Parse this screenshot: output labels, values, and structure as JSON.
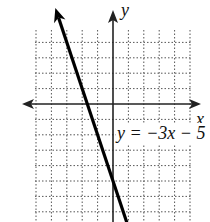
{
  "chart_data": {
    "type": "line",
    "title": "",
    "xlabel": "x",
    "ylabel": "y",
    "equation_label": "y = −3x − 5",
    "grid": true,
    "grid_style": "dotted",
    "xlim": [
      -5,
      5
    ],
    "ylim": [
      -7.5,
      5
    ],
    "series": [
      {
        "name": "y = -3x - 5",
        "slope": -3,
        "intercept": -5,
        "x": [
          -2.0,
          -1.6667,
          0,
          0.5
        ],
        "y": [
          1.0,
          0,
          -5,
          -6.5
        ]
      }
    ],
    "axis_arrows": true
  },
  "labels": {
    "x_axis": "x",
    "y_axis": "y",
    "equation": "y = −3x − 5"
  }
}
